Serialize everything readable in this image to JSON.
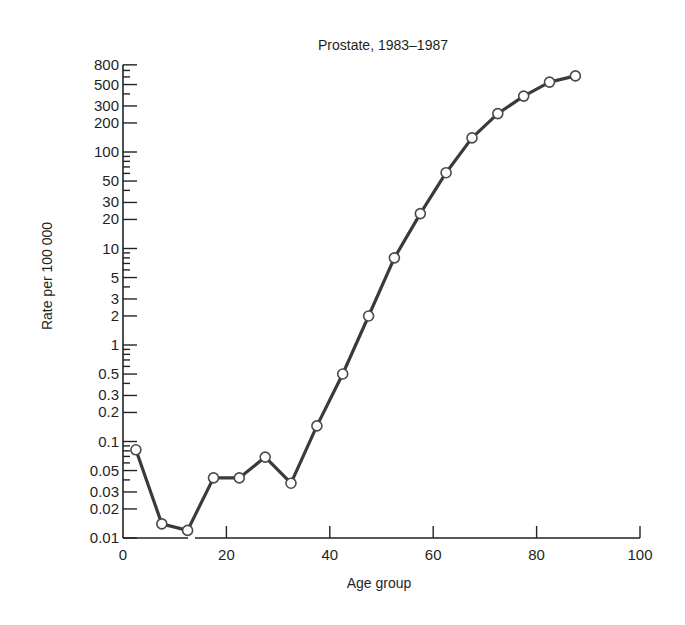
{
  "chart_data": {
    "type": "line",
    "title": "Prostate, 1983–1987",
    "xlabel": "Age group",
    "ylabel": "Rate per 100 000",
    "yscale": "log",
    "xlim": [
      0,
      100
    ],
    "ylim": [
      0.01,
      800
    ],
    "grid": false,
    "legend": null,
    "x_ticks": [
      0,
      20,
      40,
      60,
      80,
      100
    ],
    "x_tick_labels": [
      "0",
      "20",
      "40",
      "60",
      "80",
      "100"
    ],
    "y_ticks": [
      0.01,
      0.02,
      0.03,
      0.05,
      0.1,
      0.2,
      0.3,
      0.5,
      1,
      2,
      3,
      5,
      10,
      20,
      30,
      50,
      100,
      200,
      300,
      500,
      800
    ],
    "y_tick_labels": [
      "0.01",
      "0.02",
      "0.03",
      "0.05",
      "0.1",
      "0.2",
      "0.3",
      "0.5",
      "1",
      "2",
      "3",
      "5",
      "10",
      "20",
      "30",
      "50",
      "100",
      "200",
      "300",
      "500",
      "800"
    ],
    "y_minor_ticks": [
      0.04,
      0.06,
      0.07,
      0.08,
      0.09,
      0.4,
      0.6,
      0.7,
      0.8,
      0.9,
      4,
      6,
      7,
      8,
      9,
      40,
      60,
      70,
      80,
      90,
      400,
      600,
      700
    ],
    "series": [
      {
        "name": "Prostate",
        "marker": "open-circle",
        "x": [
          2.5,
          7.5,
          12.5,
          17.5,
          22.5,
          27.5,
          32.5,
          37.5,
          42.5,
          47.5,
          52.5,
          57.5,
          62.5,
          67.5,
          72.5,
          77.5,
          82.5,
          87.5
        ],
        "values": [
          0.082,
          0.014,
          0.012,
          0.042,
          0.042,
          0.069,
          0.037,
          0.145,
          0.5,
          2.0,
          8.0,
          23,
          61,
          140,
          250,
          380,
          530,
          615
        ]
      }
    ]
  }
}
